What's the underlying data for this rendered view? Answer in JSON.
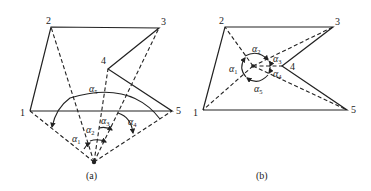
{
  "diagram": {
    "panels": [
      {
        "id": "a",
        "caption": "(a)",
        "vertices": [
          "1",
          "2",
          "3",
          "4",
          "5"
        ],
        "angles": [
          {
            "symbol": "α",
            "sub": "1"
          },
          {
            "symbol": "α",
            "sub": "2"
          },
          {
            "symbol": "α",
            "sub": "3"
          },
          {
            "symbol": "α",
            "sub": "4"
          },
          {
            "symbol": "α",
            "sub": "5"
          }
        ]
      },
      {
        "id": "b",
        "caption": "(b)",
        "vertices": [
          "1",
          "2",
          "3",
          "4",
          "5"
        ],
        "angles": [
          {
            "symbol": "α",
            "sub": "1"
          },
          {
            "symbol": "α",
            "sub": "2"
          },
          {
            "symbol": "α",
            "sub": "3"
          },
          {
            "symbol": "α",
            "sub": "4"
          },
          {
            "symbol": "α",
            "sub": "5"
          }
        ]
      }
    ]
  }
}
